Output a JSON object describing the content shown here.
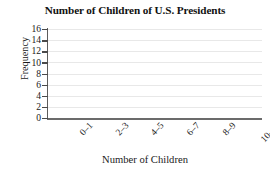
{
  "chart_data": {
    "type": "bar",
    "title": "Number of Children of U.S. Presidents",
    "xlabel": "Number of Children",
    "ylabel": "Frequency",
    "categories": [
      "0–1",
      "2–3",
      "4–5",
      "6–7",
      "8–9",
      "10–11"
    ],
    "values": [
      null,
      null,
      null,
      null,
      null,
      null
    ],
    "yticks": [
      16,
      14,
      12,
      10,
      8,
      6,
      4,
      2,
      0
    ],
    "ylim": [
      0,
      16
    ],
    "grid": "horizontal",
    "legend": "none",
    "colors": {
      "background": "#ffffff",
      "gridline": "#e8e8e8",
      "axis": "#5c5c5c",
      "text": "#1a1a1a"
    }
  }
}
